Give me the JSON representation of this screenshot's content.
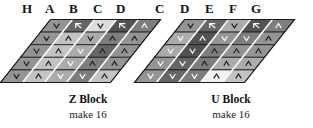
{
  "figure": {
    "kind": "quilt-block-diagram",
    "background": "#ffffff",
    "outline_color": "#1a1a1a",
    "seam_color": "#ffffff",
    "mark_color_light": "#ffffff",
    "mark_color_dark": "#1c1c1c",
    "shades": {
      "s1": "#f3f3f3",
      "s2": "#dcdcdc",
      "s3": "#c3c3c3",
      "s4": "#ababab",
      "s5": "#949494",
      "s6": "#7d7d7d",
      "s7": "#666666",
      "s8": "#525252"
    }
  },
  "blocks": [
    {
      "id": "z-block",
      "title": "Z Block",
      "subtitle": "make 16",
      "fabric_labels": [
        "H",
        "A",
        "B",
        "C",
        "D"
      ],
      "label_x": [
        22,
        44,
        68,
        93,
        116
      ],
      "columns": [
        {
          "label": "H",
          "cells": [
            {
              "shade": "#949494",
              "mark": "down",
              "mark_tone": "dark"
            },
            {
              "shade": "#949494",
              "mark": "down",
              "mark_tone": "dark"
            },
            {
              "shade": "#949494",
              "mark": "down",
              "mark_tone": "dark"
            },
            {
              "shade": "#949494",
              "mark": "down",
              "mark_tone": "dark"
            },
            {
              "shade": "#949494",
              "mark": "down",
              "mark_tone": "dark"
            }
          ]
        },
        {
          "label": "A",
          "cells": [
            {
              "shade": "#666666",
              "mark": "zig",
              "mark_tone": "light"
            },
            {
              "shade": "#c3c3c3",
              "mark": "up",
              "mark_tone": "dark"
            },
            {
              "shade": "#c3c3c3",
              "mark": "up",
              "mark_tone": "dark"
            },
            {
              "shade": "#c3c3c3",
              "mark": "up",
              "mark_tone": "dark"
            },
            {
              "shade": "#c3c3c3",
              "mark": "up",
              "mark_tone": "dark"
            }
          ]
        },
        {
          "label": "B",
          "cells": [
            {
              "shade": "#dcdcdc",
              "mark": "down",
              "mark_tone": "dark"
            },
            {
              "shade": "#ababab",
              "mark": "down",
              "mark_tone": "dark"
            },
            {
              "shade": "#ababab",
              "mark": "down",
              "mark_tone": "light"
            },
            {
              "shade": "#ababab",
              "mark": "down",
              "mark_tone": "light"
            },
            {
              "shade": "#ababab",
              "mark": "down",
              "mark_tone": "light"
            }
          ]
        },
        {
          "label": "C",
          "cells": [
            {
              "shade": "#525252",
              "mark": "zig",
              "mark_tone": "light"
            },
            {
              "shade": "#7d7d7d",
              "mark": "up",
              "mark_tone": "dark"
            },
            {
              "shade": "#666666",
              "mark": "up",
              "mark_tone": "dark"
            },
            {
              "shade": "#7d7d7d",
              "mark": "up",
              "mark_tone": "dark"
            },
            {
              "shade": "#7d7d7d",
              "mark": "down",
              "mark_tone": "light"
            }
          ]
        },
        {
          "label": "D",
          "cells": [
            {
              "shade": "#7d7d7d",
              "mark": "up",
              "mark_tone": "light"
            },
            {
              "shade": "#949494",
              "mark": "up",
              "mark_tone": "dark"
            },
            {
              "shade": "#949494",
              "mark": "up",
              "mark_tone": "dark"
            },
            {
              "shade": "#949494",
              "mark": "up",
              "mark_tone": "dark"
            },
            {
              "shade": "#c3c3c3",
              "mark": "up",
              "mark_tone": "dark"
            }
          ]
        }
      ]
    },
    {
      "id": "u-block",
      "title": "U Block",
      "subtitle": "make 16",
      "fabric_labels": [
        "C",
        "D",
        "E",
        "F",
        "G"
      ],
      "label_x": [
        155,
        180,
        205,
        229,
        251
      ],
      "columns": [
        {
          "label": "C",
          "cells": [
            {
              "shade": "#949494",
              "mark": "down",
              "mark_tone": "dark"
            },
            {
              "shade": "#ababab",
              "mark": "down",
              "mark_tone": "light"
            },
            {
              "shade": "#ababab",
              "mark": "down",
              "mark_tone": "light"
            },
            {
              "shade": "#949494",
              "mark": "down",
              "mark_tone": "light"
            },
            {
              "shade": "#949494",
              "mark": "down",
              "mark_tone": "light"
            }
          ]
        },
        {
          "label": "D",
          "cells": [
            {
              "shade": "#666666",
              "mark": "zig",
              "mark_tone": "light"
            },
            {
              "shade": "#525252",
              "mark": "up",
              "mark_tone": "light"
            },
            {
              "shade": "#525252",
              "mark": "down",
              "mark_tone": "light"
            },
            {
              "shade": "#666666",
              "mark": "down",
              "mark_tone": "light"
            },
            {
              "shade": "#666666",
              "mark": "down",
              "mark_tone": "light"
            }
          ]
        },
        {
          "label": "E",
          "cells": [
            {
              "shade": "#ababab",
              "mark": "down",
              "mark_tone": "dark"
            },
            {
              "shade": "#949494",
              "mark": "down",
              "mark_tone": "light"
            },
            {
              "shade": "#7d7d7d",
              "mark": "up",
              "mark_tone": "dark"
            },
            {
              "shade": "#7d7d7d",
              "mark": "up",
              "mark_tone": "dark"
            },
            {
              "shade": "#7d7d7d",
              "mark": "down",
              "mark_tone": "light"
            }
          ]
        },
        {
          "label": "F",
          "cells": [
            {
              "shade": "#525252",
              "mark": "zig",
              "mark_tone": "light"
            },
            {
              "shade": "#7d7d7d",
              "mark": "down",
              "mark_tone": "light"
            },
            {
              "shade": "#949494",
              "mark": "up",
              "mark_tone": "dark"
            },
            {
              "shade": "#ababab",
              "mark": "up",
              "mark_tone": "dark"
            },
            {
              "shade": "#f3f3f3",
              "mark": "up",
              "mark_tone": "dark"
            }
          ]
        },
        {
          "label": "G",
          "cells": [
            {
              "shade": "#7d7d7d",
              "mark": "up",
              "mark_tone": "light"
            },
            {
              "shade": "#949494",
              "mark": "up",
              "mark_tone": "dark"
            },
            {
              "shade": "#949494",
              "mark": "up",
              "mark_tone": "dark"
            },
            {
              "shade": "#ababab",
              "mark": "up",
              "mark_tone": "dark"
            },
            {
              "shade": "#c3c3c3",
              "mark": "up",
              "mark_tone": "dark"
            }
          ]
        }
      ]
    }
  ]
}
